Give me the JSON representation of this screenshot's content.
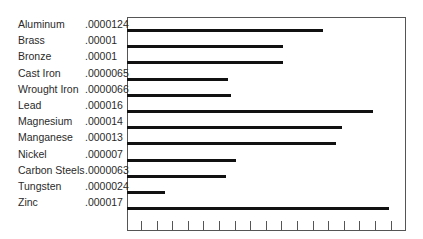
{
  "chart_data": {
    "type": "bar",
    "orientation": "horizontal",
    "title": "",
    "xlabel": "",
    "ylabel": "",
    "categories": [
      "Aluminum",
      "Brass",
      "Bronze",
      "Cast Iron",
      "Wrought Iron",
      "Lead",
      "Magnesium",
      "Manganese",
      "Nickel",
      "Carbon Steels",
      "Tungsten",
      "Zinc"
    ],
    "value_labels": [
      ".0000124",
      ".00001",
      ".00001",
      ".0000065",
      ".0000066",
      ".000016",
      ".000014",
      ".000013",
      ".000007",
      ".0000063",
      ".0000024",
      ".000017"
    ],
    "values": [
      1.24e-05,
      1e-05,
      1e-05,
      6.5e-06,
      6.6e-06,
      1.6e-05,
      1.4e-05,
      1.3e-05,
      7e-06,
      6.3e-06,
      2.4e-06,
      1.7e-05
    ],
    "bar_end_px": [
      323,
      283,
      283,
      228,
      231,
      373,
      342,
      336,
      236,
      226,
      165,
      389
    ],
    "tick_count": 17,
    "grid": false,
    "legend": null
  },
  "rows": [
    {
      "name": "Aluminum",
      "value": ".0000124"
    },
    {
      "name": "Brass",
      "value": ".00001"
    },
    {
      "name": "Bronze",
      "value": ".00001"
    },
    {
      "name": "Cast Iron",
      "value": ".0000065"
    },
    {
      "name": "Wrought Iron",
      "value": ".0000066"
    },
    {
      "name": "Lead",
      "value": ".000016"
    },
    {
      "name": "Magnesium",
      "value": ".000014"
    },
    {
      "name": "Manganese",
      "value": ".000013"
    },
    {
      "name": "Nickel",
      "value": ".000007"
    },
    {
      "name": "Carbon Steels",
      "value": ".0000063"
    },
    {
      "name": "Tungsten",
      "value": ".0000024"
    },
    {
      "name": "Zinc",
      "value": ".000017"
    }
  ],
  "colors": {
    "bar": "#111111",
    "frame": "#555555",
    "text": "#2a2a2a"
  }
}
